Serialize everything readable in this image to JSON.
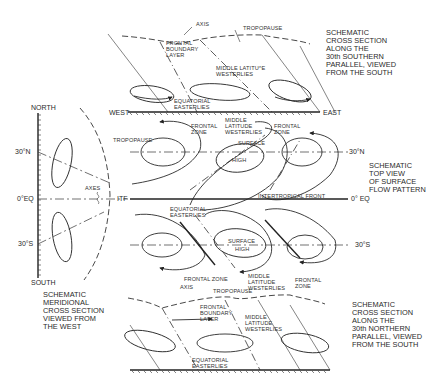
{
  "figure": {
    "type": "schematic atmospheric circulation diagram",
    "panels": [
      {
        "id": "top_cross_section",
        "caption": "SCHEMATIC\nCROSS SECTION\nALONG THE\n30th SOUTHERN\nPARALLEL, VIEWED\nFROM THE SOUTH",
        "labels": {
          "axis": "AXIS",
          "tropopause": "TROPOPAUSE",
          "frontal_boundary_layer": "FRONTAL\nBOUNDARY\nLAYER",
          "middle_latitude_westerlies": "MIDDLE LATITU^E\nWESTERLIES",
          "equatorial_easterlies": "EQUATORIAL\nEASTERLIES",
          "west": "WEST",
          "east": "EAST"
        }
      },
      {
        "id": "top_view",
        "caption": "SCHEMATIC\nTOP VIEW\nOF SURFACE\nFLOW PATTERN",
        "labels": {
          "frontal_zone_nw": "FRONTAL\nZONE",
          "middle_latitude_westerlies_n": "MIDDLE\nLATITUDE\nWESTERLIES",
          "frontal_zone_ne": "FRONTAL\nZONE",
          "surface_high_n": "SURFACE",
          "high_n": "HIGH",
          "tropopause": "TROPOPAUSE",
          "intertropical_front": "INTERTROPICAL FRONT",
          "equatorial_easterlies": "EQUATORIAL\nEASTERLIES",
          "surface_high_s": "SURFACE",
          "high_s": "HIGH",
          "frontal_zone_sw": "FRONTAL ZONE",
          "middle_latitude_westerlies_s": "MIDDLE\nLATITUDE\nWESTERLIES",
          "frontal_zone_se": "FRONTAL\nZONE",
          "lat_30n": "30°N",
          "lat_0": "0° EQ",
          "lat_30s": "30°S"
        }
      },
      {
        "id": "meridional_section",
        "caption": "SCHEMATIC\nMERIDIONAL\nCROSS SECTION\nVIEWED FROM\nTHE WEST",
        "labels": {
          "north": "NORTH",
          "south": "SOUTH",
          "lat_30n": "30°N",
          "lat_0": "0°EQ",
          "lat_30s": "30°S",
          "axes": "AXES",
          "itf": "ITF"
        }
      },
      {
        "id": "bottom_cross_section",
        "caption": "SCHEMATIC\nCROSS SECTION\nALONG THE\n30th NORTHERN\nPARALLEL, VIEWED\nFROM THE SOUTH",
        "labels": {
          "axis": "AXIS",
          "tropopause": "TROPOPAUSE",
          "frontal_boundary_layer": "FRONTAL\nBOUNDARY\nLAYER",
          "middle_latitude_westerlies": "MIDDLE\nLATITUDE\nWESTERLIES",
          "equatorial_easterlies": "EQUATORIAL\nEASTERLIES"
        }
      }
    ]
  }
}
